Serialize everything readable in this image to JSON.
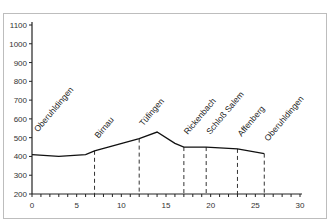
{
  "chart_data": {
    "type": "line",
    "title": "",
    "xlabel": "",
    "ylabel": "",
    "xlim": [
      0,
      30
    ],
    "ylim": [
      200,
      1100
    ],
    "x_ticks": [
      0,
      5,
      10,
      15,
      20,
      25,
      30
    ],
    "y_ticks": [
      200,
      300,
      400,
      500,
      600,
      700,
      800,
      900,
      1000,
      1100
    ],
    "grid": false,
    "legend": null,
    "series": [
      {
        "name": "Elevation profile",
        "x": [
          0,
          3,
          6,
          7,
          12,
          14,
          16,
          17,
          19.5,
          23,
          26
        ],
        "y": [
          410,
          400,
          410,
          430,
          495,
          530,
          470,
          450,
          450,
          440,
          415
        ]
      }
    ],
    "annotations": [
      {
        "label": "Oberuhldingen",
        "x": 0
      },
      {
        "label": "Birnau",
        "x": 7
      },
      {
        "label": "Tüfingen",
        "x": 12
      },
      {
        "label": "Rickenbach",
        "x": 17
      },
      {
        "label": "Schloß Salem",
        "x": 19.5
      },
      {
        "label": "Affenberg",
        "x": 23
      },
      {
        "label": "Oberuhldingen",
        "x": 26
      }
    ],
    "drop_lines_at": [
      7,
      12,
      17,
      19.5,
      23,
      26
    ]
  }
}
